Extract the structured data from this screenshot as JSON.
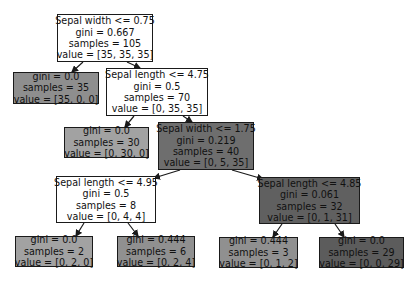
{
  "tree": {
    "nodes": [
      {
        "id": "n0",
        "lines": [
          "Sepal width <= 0.75",
          "gini = 0.667",
          "samples = 105",
          "value = [35, 35, 35]"
        ],
        "fill": "#ffffff",
        "x": 57,
        "y": 14,
        "w": 96,
        "h": 48
      },
      {
        "id": "n1",
        "lines": [
          "gini = 0.0",
          "samples = 35",
          "value = [35, 0, 0]"
        ],
        "fill": "#8e8e8e",
        "x": 13,
        "y": 72,
        "w": 86,
        "h": 32
      },
      {
        "id": "n2",
        "lines": [
          "Sepal length <= 4.75",
          "gini = 0.5",
          "samples = 70",
          "value = [0, 35, 35]"
        ],
        "fill": "#ffffff",
        "x": 106,
        "y": 68,
        "w": 102,
        "h": 48
      },
      {
        "id": "n3",
        "lines": [
          "gini = 0.0",
          "samples = 30",
          "value = [0, 30, 0]"
        ],
        "fill": "#a2a2a2",
        "x": 64,
        "y": 127,
        "w": 85,
        "h": 31
      },
      {
        "id": "n4",
        "lines": [
          "Sepal width <= 1.75",
          "gini = 0.219",
          "samples = 40",
          "value = [0, 5, 35]"
        ],
        "fill": "#6e6e6e",
        "x": 158,
        "y": 122,
        "w": 96,
        "h": 48
      },
      {
        "id": "n5",
        "lines": [
          "Sepal length <= 4.95",
          "gini = 0.5",
          "samples = 8",
          "value = [0, 4, 4]"
        ],
        "fill": "#ffffff",
        "x": 56,
        "y": 176,
        "w": 100,
        "h": 47
      },
      {
        "id": "n6",
        "lines": [
          "gini = 0.0",
          "samples = 2",
          "value = [0, 2, 0]"
        ],
        "fill": "#a2a2a2",
        "x": 15,
        "y": 236,
        "w": 78,
        "h": 31
      },
      {
        "id": "n7",
        "lines": [
          "gini = 0.444",
          "samples = 6",
          "value = [0, 2, 4]"
        ],
        "fill": "#909090",
        "x": 117,
        "y": 236,
        "w": 78,
        "h": 31
      },
      {
        "id": "n8",
        "lines": [
          "Sepal length <= 4.85",
          "gini = 0.061",
          "samples = 32",
          "value = [0, 1, 31]"
        ],
        "fill": "#606060",
        "x": 259,
        "y": 177,
        "w": 101,
        "h": 47
      },
      {
        "id": "n9",
        "lines": [
          "gini = 0.444",
          "samples = 3",
          "value = [0, 1, 2]"
        ],
        "fill": "#909090",
        "x": 219,
        "y": 237,
        "w": 79,
        "h": 31
      },
      {
        "id": "n10",
        "lines": [
          "gini = 0.0",
          "samples = 29",
          "value = [0, 0, 29]"
        ],
        "fill": "#5c5c5c",
        "x": 319,
        "y": 237,
        "w": 85,
        "h": 31
      }
    ],
    "edges": [
      {
        "from": [
          83,
          62
        ],
        "to": [
          72,
          72
        ]
      },
      {
        "from": [
          127,
          62
        ],
        "to": [
          140,
          68
        ]
      },
      {
        "from": [
          134,
          116
        ],
        "to": [
          125,
          127
        ]
      },
      {
        "from": [
          183,
          116
        ],
        "to": [
          192,
          122
        ]
      },
      {
        "from": [
          180,
          170
        ],
        "to": [
          154,
          178
        ]
      },
      {
        "from": [
          232,
          170
        ],
        "to": [
          263,
          179
        ]
      },
      {
        "from": [
          84,
          223
        ],
        "to": [
          76,
          236
        ]
      },
      {
        "from": [
          128,
          223
        ],
        "to": [
          138,
          236
        ]
      },
      {
        "from": [
          282,
          224
        ],
        "to": [
          273,
          237
        ]
      },
      {
        "from": [
          335,
          224
        ],
        "to": [
          344,
          237
        ]
      }
    ],
    "edge_color": "#1a1a1a"
  }
}
